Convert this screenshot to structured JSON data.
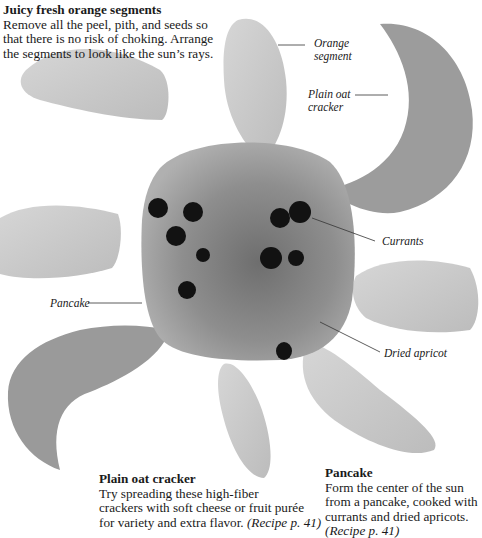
{
  "captions": {
    "orange": {
      "title": "Juicy fresh orange segments",
      "lines": [
        "Remove all the peel, pith, and seeds so",
        "that there is no risk of choking. Arrange",
        "the segments to look like the sun’s rays."
      ]
    },
    "cracker": {
      "title": "Plain oat cracker",
      "lines": [
        "Try spreading these high-fiber",
        "crackers with soft cheese or fruit purée",
        "for variety and extra flavor. "
      ],
      "ref": "(Recipe p. 41)"
    },
    "pancake": {
      "title": "Pancake",
      "lines": [
        "Form the center of the sun",
        "from a pancake, cooked with",
        "currants and dried apricots."
      ],
      "ref": "(Recipe p. 41)"
    }
  },
  "labels": {
    "orange_segment": [
      "Orange",
      "segment"
    ],
    "oat_cracker": [
      "Plain oat",
      "cracker"
    ],
    "currants": "Currants",
    "pancake": "Pancake",
    "dried_apricot": "Dried apricot"
  },
  "colors": {
    "orange_segment": "#c8c8c8",
    "cracker": "#9a9a9a",
    "pancake": "#8c8c8c",
    "currant": "#121212",
    "text": "#1a1a1a"
  }
}
